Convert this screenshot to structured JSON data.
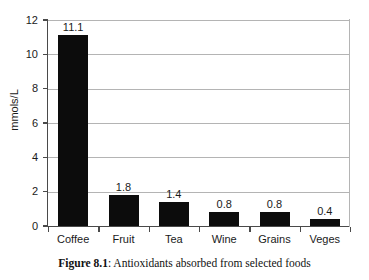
{
  "chart_data": {
    "type": "bar",
    "title": "",
    "xlabel": "",
    "ylabel": "mmols/L",
    "categories": [
      "Coffee",
      "Fruit",
      "Tea",
      "Wine",
      "Grains",
      "Veges"
    ],
    "values": [
      11.1,
      1.8,
      1.4,
      0.8,
      0.8,
      0.4
    ],
    "data_labels": [
      "11.1",
      "1.8",
      "1.4",
      "0.8",
      "0.8",
      "0.4"
    ],
    "ylim": [
      0,
      12
    ],
    "yticks": [
      0,
      2,
      4,
      6,
      8,
      10,
      12
    ],
    "ytick_labels": [
      "0",
      "2",
      "4",
      "6",
      "8",
      "10",
      "12"
    ],
    "grid": "horizontal",
    "legend": "none",
    "bar_color": "#0c0c0c",
    "gridline_color": "#b4b4b4",
    "axis_color": "#4a4a4a"
  },
  "caption": {
    "label": "Figure 8.1",
    "separator": ": ",
    "text": "Antioxidants absorbed from selected foods"
  }
}
